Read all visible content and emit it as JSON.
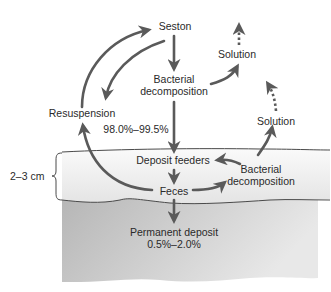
{
  "diagram": {
    "type": "sediment-cycle",
    "colors": {
      "arrow": "#5a5a5a",
      "text": "#2a2a2a",
      "sediment_top": "#efefef",
      "sediment_gradient_left": "#b8b8b8",
      "sediment_gradient_right": "#e6e6e6",
      "boundary_line": "#4a4a4a"
    },
    "nodes": {
      "seston": "Seston",
      "bacterial_decomposition_water": [
        "Bacterial",
        "decomposition"
      ],
      "solution_upper": "Solution",
      "resuspension": "Resuspension",
      "percent_recycled": "98.0%–99.5%",
      "solution_lower": "Solution",
      "deposit_feeders": "Deposit feeders",
      "bacterial_decomposition_sediment": [
        "Bacterial",
        "decomposition"
      ],
      "feces": "Feces",
      "permanent_deposit": "Permanent deposit",
      "percent_permanent": "0.5%–2.0%"
    },
    "scale": {
      "depth_label": "2–3 cm"
    },
    "edges": [
      {
        "from": "Resuspension",
        "to": "Seston",
        "style": "solid"
      },
      {
        "from": "Seston",
        "to": "Resuspension",
        "style": "solid"
      },
      {
        "from": "Seston",
        "to": "Bacterial decomposition (water)",
        "style": "solid"
      },
      {
        "from": "Bacterial decomposition (water)",
        "to": "Solution (upper)",
        "style": "solid"
      },
      {
        "from": "Solution (upper)",
        "to": "out",
        "style": "dotted"
      },
      {
        "from": "Bacterial decomposition (water)",
        "to": "Deposit feeders",
        "style": "solid"
      },
      {
        "from": "Deposit feeders",
        "to": "Feces",
        "style": "solid"
      },
      {
        "from": "Feces",
        "to": "Resuspension",
        "style": "solid"
      },
      {
        "from": "Feces",
        "to": "Bacterial decomposition (sediment)",
        "style": "solid"
      },
      {
        "from": "Bacterial decomposition (sediment)",
        "to": "Deposit feeders",
        "style": "solid"
      },
      {
        "from": "Bacterial decomposition (sediment)",
        "to": "Solution (lower)",
        "style": "solid"
      },
      {
        "from": "Solution (lower)",
        "to": "out",
        "style": "dotted"
      },
      {
        "from": "Feces",
        "to": "Permanent deposit",
        "style": "solid"
      }
    ]
  }
}
